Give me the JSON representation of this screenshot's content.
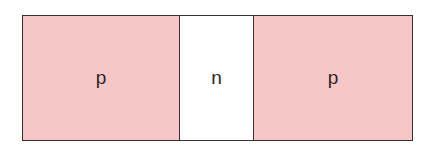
{
  "diagram": {
    "type": "pnp-semiconductor-structure",
    "regions": [
      {
        "label": "p",
        "type": "p-type",
        "fill": "#f7c6c6"
      },
      {
        "label": "n",
        "type": "n-type",
        "fill": "#ffffff"
      },
      {
        "label": "p",
        "type": "p-type",
        "fill": "#f7c6c6"
      }
    ],
    "border_color": "#3a2e2e"
  }
}
